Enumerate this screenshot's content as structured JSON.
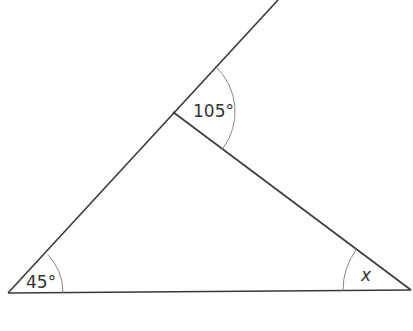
{
  "diagram": {
    "type": "geometry-triangle",
    "angles": {
      "bottom_left": "45°",
      "exterior_top": "105°",
      "bottom_right": "x"
    },
    "colors": {
      "line": "#3a3a3a",
      "arc": "#888888",
      "text": "#333333"
    }
  }
}
